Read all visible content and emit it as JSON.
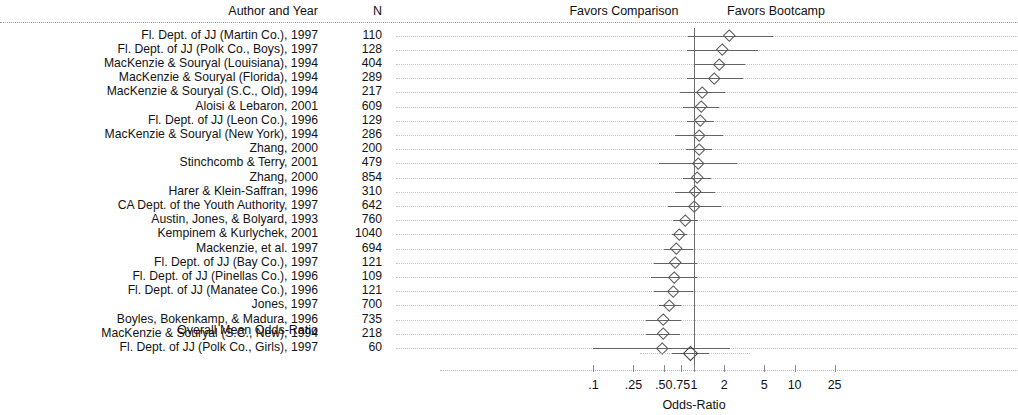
{
  "header": {
    "author_col": "Author and Year",
    "n_col": "N",
    "favors_left": "Favors Comparison",
    "favors_right": "Favors Bootcamp"
  },
  "overall": {
    "label": "Overall Mean Odds-Ratio",
    "or": 0.93,
    "ci_low": 0.84,
    "ci_high": 1.03
  },
  "axis": {
    "title": "Odds-Ratio",
    "scale": "log",
    "ticks": [
      {
        "label": ".1",
        "value": 0.1
      },
      {
        "label": ".25",
        "value": 0.25
      },
      {
        "label": ".50",
        "value": 0.5
      },
      {
        "label": ".75",
        "value": 0.75
      },
      {
        "label": "1",
        "value": 1
      },
      {
        "label": "2",
        "value": 2
      },
      {
        "label": "5",
        "value": 5
      },
      {
        "label": "10",
        "value": 10
      },
      {
        "label": "25",
        "value": 25
      }
    ],
    "null_value": 1
  },
  "chart_data": {
    "type": "forest",
    "title": "",
    "xlabel": "Odds-Ratio",
    "ylabel": "",
    "xscale": "log",
    "xlim": [
      0.085,
      29
    ],
    "grid": "dotted row guides",
    "legend": [
      "Favors Comparison",
      "Favors Bootcamp"
    ],
    "columns": [
      "Author and Year",
      "N",
      "Odds-Ratio",
      "95% CI"
    ],
    "null_line": 1,
    "rows": [
      {
        "author": "Fl. Dept. of JJ (Martin Co.), 1997",
        "n": "110",
        "or": 2.25,
        "ci_low": 0.88,
        "ci_high": 6.05
      },
      {
        "author": "Fl. Dept. of JJ (Polk Co., Boys), 1997",
        "n": "128",
        "or": 1.9,
        "ci_low": 0.85,
        "ci_high": 4.3
      },
      {
        "author": "MacKenzie & Souryal (Louisiana), 1994",
        "n": "404",
        "or": 1.8,
        "ci_low": 1.0,
        "ci_high": 3.25
      },
      {
        "author": "MacKenzie & Souryal (Florida), 1994",
        "n": "289",
        "or": 1.6,
        "ci_low": 0.86,
        "ci_high": 3.1
      },
      {
        "author": "MacKenzie & Souryal (S.C., Old), 1994",
        "n": "217",
        "or": 1.22,
        "ci_low": 0.73,
        "ci_high": 2.05
      },
      {
        "author": "Aloisi & Lebaron, 2001",
        "n": "609",
        "or": 1.18,
        "ci_low": 0.78,
        "ci_high": 1.78
      },
      {
        "author": "Fl. Dept. of JJ (Leon Co.), 1996",
        "n": "129",
        "or": 1.16,
        "ci_low": 0.85,
        "ci_high": 1.58
      },
      {
        "author": "MacKenzie & Souryal (New York), 1994",
        "n": "286",
        "or": 1.14,
        "ci_low": 0.64,
        "ci_high": 1.95
      },
      {
        "author": "Zhang, 2000",
        "n": "200",
        "or": 1.12,
        "ci_low": 0.83,
        "ci_high": 1.52
      },
      {
        "author": "Stinchcomb & Terry, 2001",
        "n": "479",
        "or": 1.1,
        "ci_low": 0.45,
        "ci_high": 2.65
      },
      {
        "author": "Zhang, 2000",
        "n": "854",
        "or": 1.07,
        "ci_low": 0.78,
        "ci_high": 1.46
      },
      {
        "author": "Harer & Klein-Saffran, 1996",
        "n": "310",
        "or": 1.03,
        "ci_low": 0.64,
        "ci_high": 1.62
      },
      {
        "author": "CA Dept. of the Youth Authority, 1997",
        "n": "642",
        "or": 1.0,
        "ci_low": 0.55,
        "ci_high": 1.84
      },
      {
        "author": "Austin, Jones, & Bolyard, 1993",
        "n": "760",
        "or": 0.82,
        "ci_low": 0.62,
        "ci_high": 1.1
      },
      {
        "author": "Kempinem & Kurlychek, 2001",
        "n": "1040",
        "or": 0.72,
        "ci_low": 0.61,
        "ci_high": 0.85
      },
      {
        "author": "Mackenzie, et al. 1997",
        "n": "694",
        "or": 0.66,
        "ci_low": 0.5,
        "ci_high": 0.98
      },
      {
        "author": "Fl. Dept. of JJ (Bay Co.), 1997",
        "n": "121",
        "or": 0.65,
        "ci_low": 0.4,
        "ci_high": 1.06
      },
      {
        "author": "Fl. Dept. of JJ (Pinellas Co.), 1996",
        "n": "109",
        "or": 0.63,
        "ci_low": 0.37,
        "ci_high": 1.08
      },
      {
        "author": "Fl. Dept. of JJ (Manatee Co.), 1996",
        "n": "121",
        "or": 0.62,
        "ci_low": 0.4,
        "ci_high": 0.98
      },
      {
        "author": "Jones, 1997",
        "n": "700",
        "or": 0.57,
        "ci_low": 0.45,
        "ci_high": 0.74
      },
      {
        "author": "Boyles, Bokenkamp, & Madura, 1996",
        "n": "735",
        "or": 0.49,
        "ci_low": 0.33,
        "ci_high": 0.74
      },
      {
        "author": "MacKenzie & Souryal (S.C., New), 1994",
        "n": "218",
        "or": 0.49,
        "ci_low": 0.33,
        "ci_high": 0.72
      },
      {
        "author": "Fl. Dept. of JJ (Polk Co., Girls), 1997",
        "n": "60",
        "or": 0.48,
        "ci_low": 0.1,
        "ci_high": 2.3
      }
    ],
    "overall": {
      "label": "Overall Mean Odds-Ratio",
      "or": 0.93,
      "ci_low": 0.84,
      "ci_high": 1.03
    }
  }
}
